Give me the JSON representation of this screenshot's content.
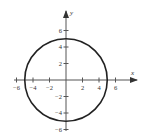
{
  "chart_data": {
    "type": "line",
    "title": "",
    "series": [
      {
        "name": "circle",
        "shape": "circle",
        "center": [
          0,
          0
        ],
        "radius": 5
      }
    ],
    "xlabel": "x",
    "ylabel": "y",
    "xlim": [
      -6.2,
      8.6
    ],
    "ylim": [
      -6.1,
      8.4
    ],
    "x_ticks": [
      -6,
      -4,
      -2,
      2,
      4,
      6
    ],
    "y_ticks": [
      6,
      4,
      2,
      -2,
      -4,
      -6
    ],
    "x_tick_labels": [
      "−6",
      "−4",
      "−2",
      "2",
      "4",
      "6"
    ],
    "y_tick_labels": [
      "6",
      "4",
      "2",
      "−2",
      "−4",
      "−6"
    ],
    "grid": false,
    "legend": null
  },
  "colors": {
    "curve": "#222222",
    "axis": "#555555",
    "text": "#333333"
  }
}
